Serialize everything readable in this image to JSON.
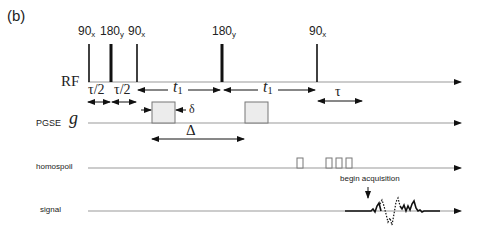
{
  "panel_label": "(b)",
  "rows": {
    "rf": "RF",
    "pgse_prefix": "PGSE",
    "pgse_symbol": "g",
    "homospoil": "homospoil",
    "signal": "signal"
  },
  "pulses": [
    {
      "angle": "90",
      "phase": "x"
    },
    {
      "angle": "180",
      "phase": "y"
    },
    {
      "angle": "90",
      "phase": "x"
    },
    {
      "angle": "180",
      "phase": "y"
    },
    {
      "angle": "90",
      "phase": "x"
    }
  ],
  "intervals": {
    "tau_half_1": "τ/2",
    "tau_half_2": "τ/2",
    "t1_first": "t",
    "t1_first_sub": "1",
    "t1_second": "t",
    "t1_second_sub": "1",
    "tau": "τ",
    "delta_small": "δ",
    "delta_big": "Δ"
  },
  "annotations": {
    "begin_acquisition": "begin acquisition"
  }
}
